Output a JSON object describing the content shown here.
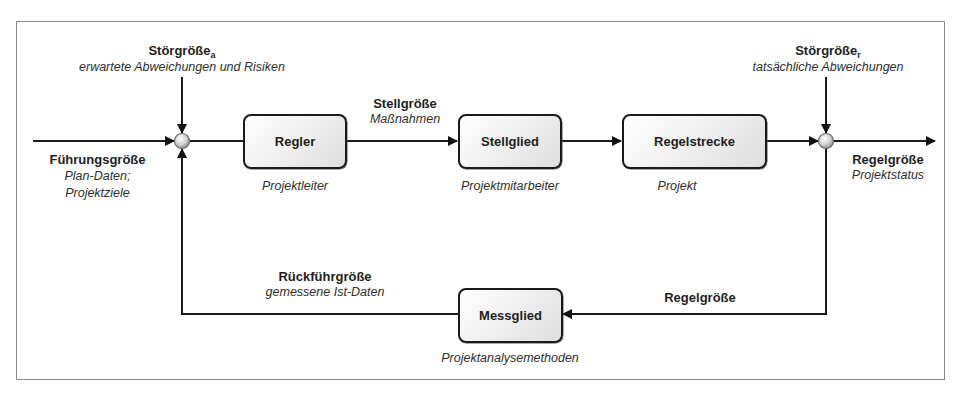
{
  "diagram": {
    "type": "control-loop",
    "blocks": {
      "regler": {
        "label": "Regler",
        "caption": "Projektleiter"
      },
      "stellglied": {
        "label": "Stellglied",
        "caption": "Projektmitarbeiter"
      },
      "regelstrecke": {
        "label": "Regelstrecke",
        "caption": "Projekt"
      },
      "messglied": {
        "label": "Messglied",
        "caption": "Projektanalysemethoden"
      }
    },
    "signals": {
      "fuehrungsgroesse": {
        "title": "Führungsgröße",
        "line1": "Plan-Daten;",
        "line2": "Projektziele"
      },
      "stoergroesse_a": {
        "title": "Störgröße",
        "subscript": "a",
        "caption": "erwartete Abweichungen und Risiken"
      },
      "stoergroesse_r": {
        "title": "Störgröße",
        "subscript": "r",
        "caption": "tatsächliche Abweichungen"
      },
      "stellgroesse": {
        "title": "Stellgröße",
        "caption": "Maßnahmen"
      },
      "regelgroesse_out": {
        "title": "Regelgröße",
        "caption": "Projektstatus"
      },
      "regelgroesse_fb": {
        "title": "Regelgröße"
      },
      "rueckfuehrgroesse": {
        "title": "Rückführgröße",
        "caption": "gemessene Ist-Daten"
      }
    },
    "colors": {
      "line": "#1a1a1a",
      "frame": "#8a8a8a",
      "junction_fill": "#d0d0d0"
    }
  }
}
